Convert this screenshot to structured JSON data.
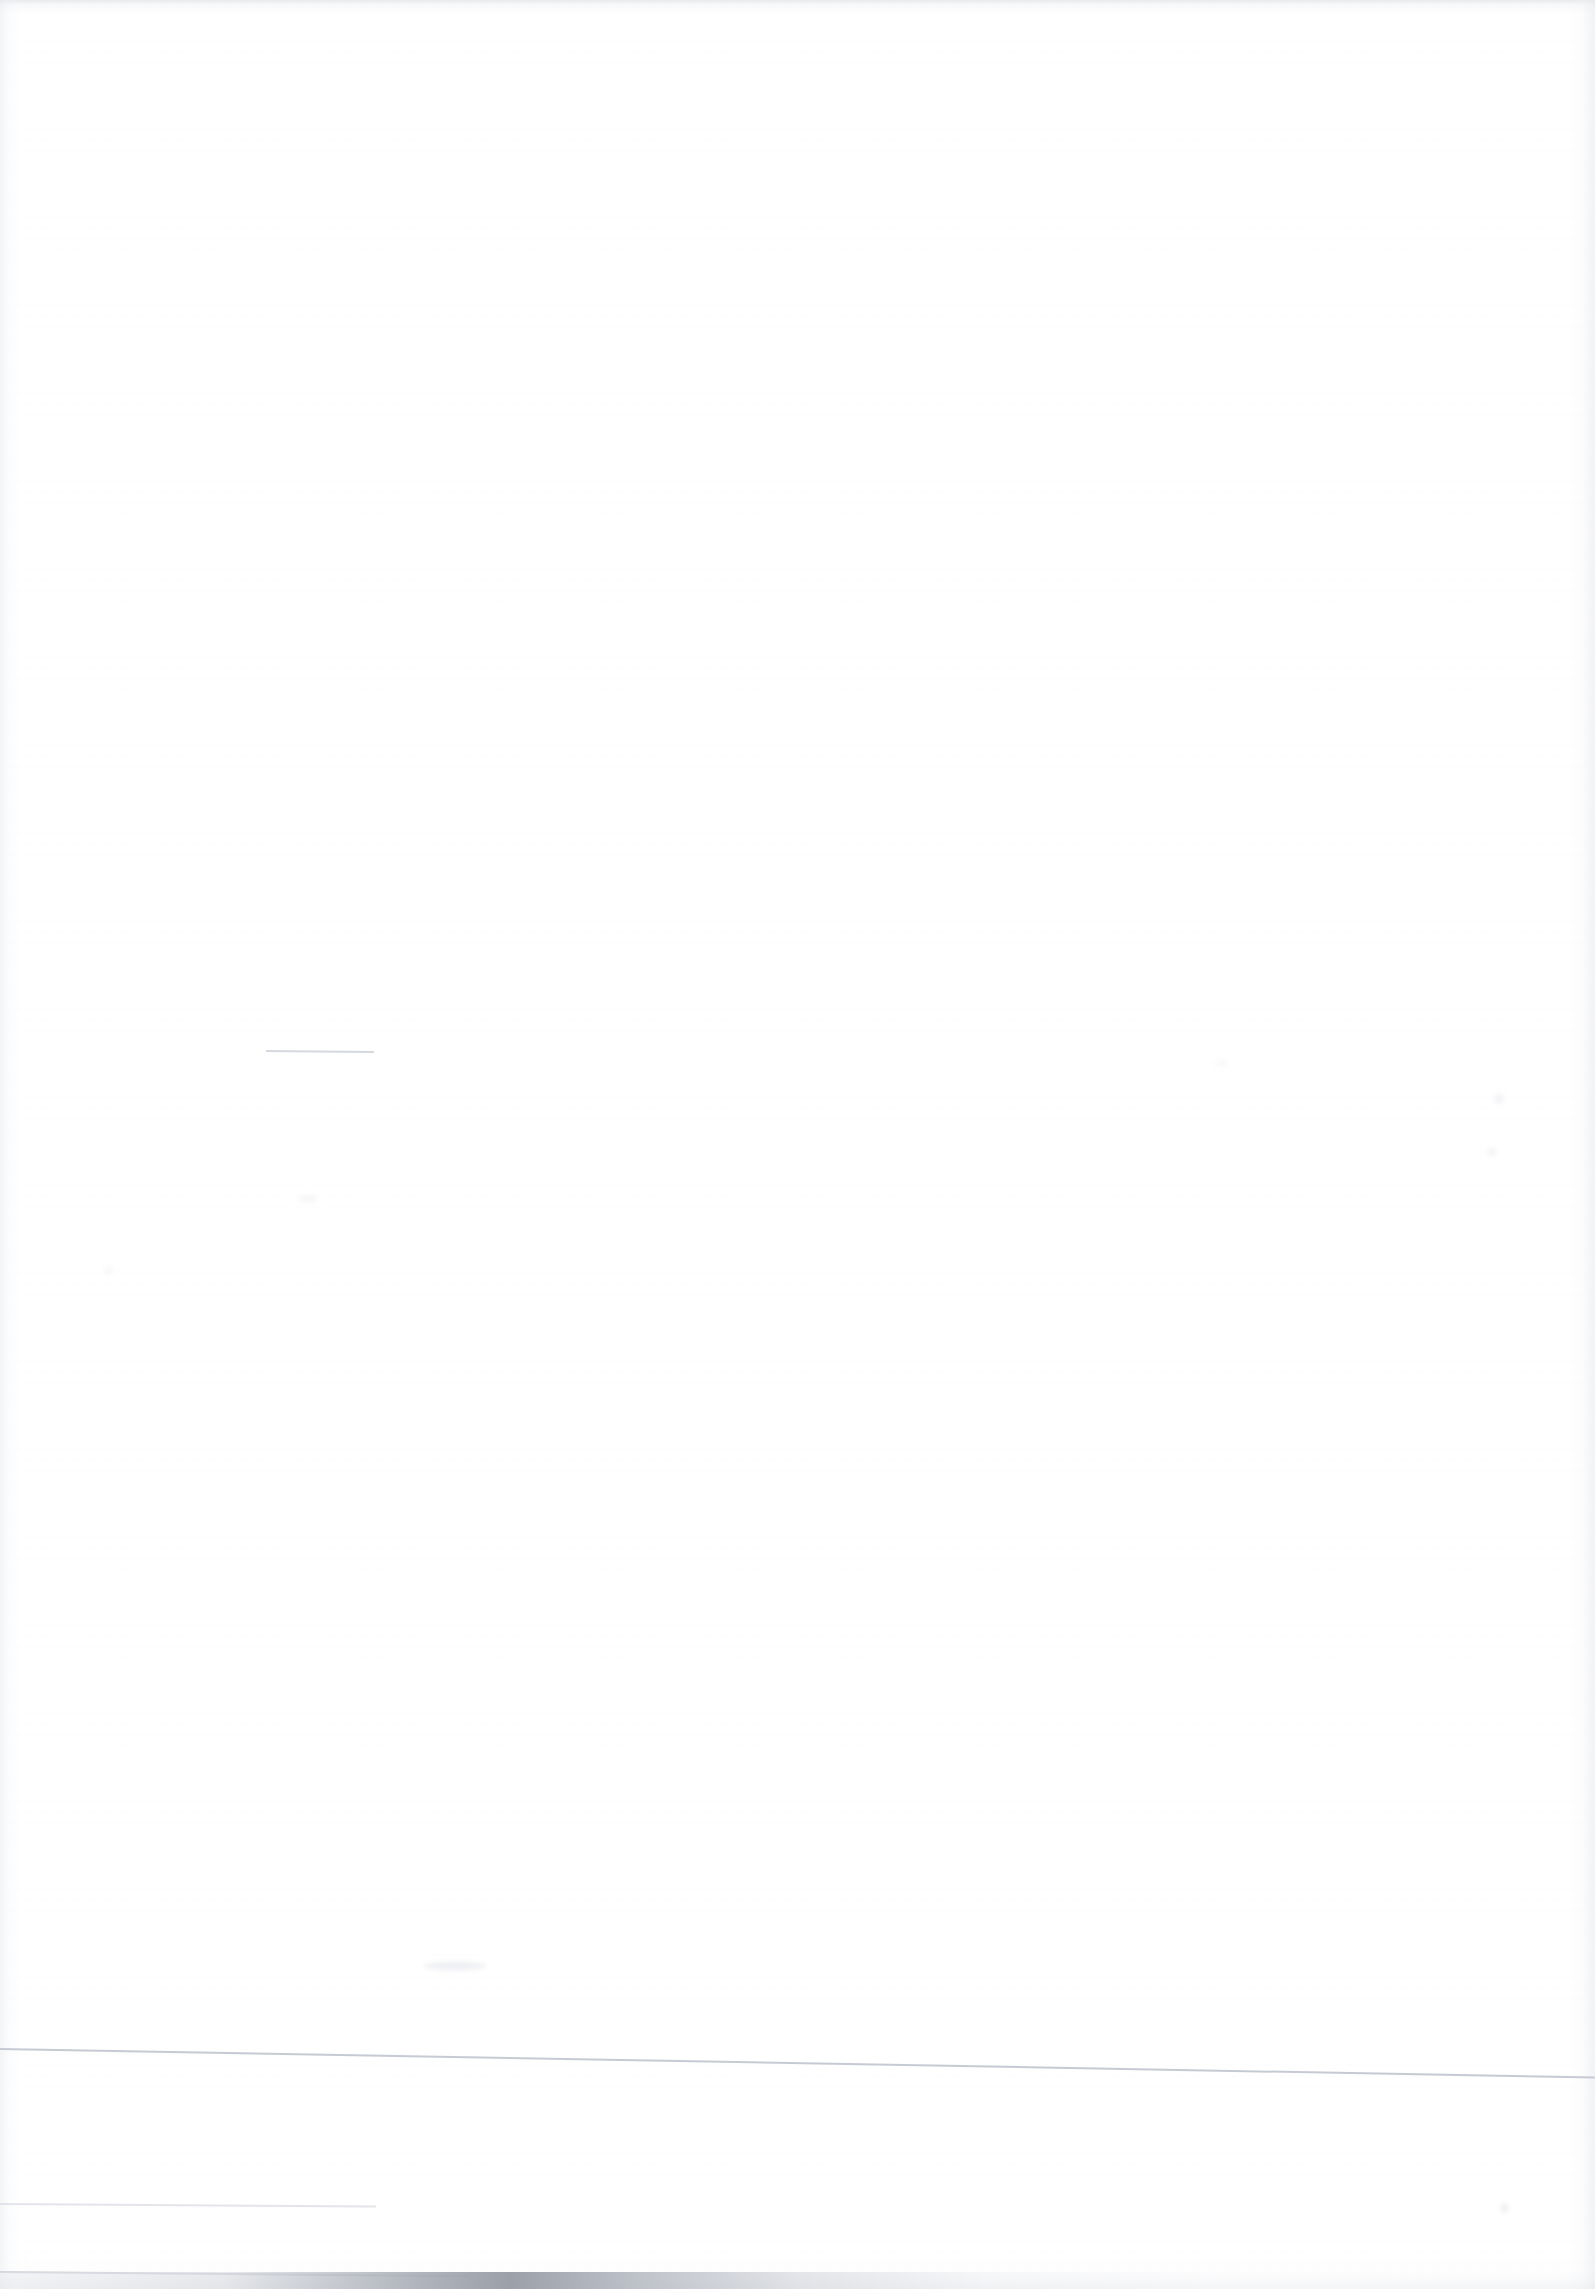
{
  "document": {
    "kind": "scanned-page",
    "orientation": "portrait",
    "page_width_px": 1595,
    "page_height_px": 2289,
    "visible_text": "",
    "content_summary": "Blank scanned document page — no legible text, headings, figures or tables are rendered in the pixels.",
    "background_color": "#ffffff",
    "paper_tint_color": "#fbfbfc"
  },
  "marks": {
    "rules": [
      {
        "id": "rule-short-upper",
        "label": "short horizontal rule",
        "color": "#c9cdd5",
        "x": 266,
        "y": 1050,
        "length": 108,
        "thickness": 2,
        "rotation_deg": 0.55
      },
      {
        "id": "rule-long-lower",
        "label": "long horizontal rule spanning page width",
        "color": "#c1c5ce",
        "x": 0,
        "y": 2048,
        "length": 1595,
        "thickness": 2,
        "rotation_deg": 1.02
      },
      {
        "id": "rule-short-lower",
        "label": "short horizontal rule near bottom left",
        "color": "#dcdfe5",
        "x": 0,
        "y": 2203,
        "length": 376,
        "thickness": 2,
        "rotation_deg": 0.38
      },
      {
        "id": "rule-bottom-edge",
        "label": "thin rule at bottom page edge",
        "color": "#c4c8d0",
        "x": 0,
        "y": 2271,
        "length": 470,
        "thickness": 2,
        "rotation_deg": 0.52
      }
    ],
    "shadows": [
      {
        "id": "edge-shadow-top",
        "label": "top edge scan shadow",
        "color": "#d5d8de",
        "edge": "top",
        "extent_px": 14
      },
      {
        "id": "edge-shadow-left",
        "label": "left edge scan shadow",
        "color": "#e8eaee",
        "edge": "left",
        "extent_px": 22
      },
      {
        "id": "edge-shadow-right",
        "label": "right edge scan shadow",
        "color": "#e6e8ed",
        "edge": "right",
        "extent_px": 26
      },
      {
        "id": "bottom-shadow-band",
        "label": "bottom edge scan shadow band",
        "color": "#969ba5",
        "edge": "bottom",
        "extent_px": 17
      }
    ],
    "speckles": [
      {
        "id": "smudge-a",
        "label": "faint smudge",
        "x": 424,
        "y": 1962,
        "color": "#e7e8ee"
      },
      {
        "id": "smudge-b",
        "label": "faint speck",
        "x": 298,
        "y": 1196,
        "color": "#f0f1f5"
      },
      {
        "id": "smudge-c",
        "label": "faint speck",
        "x": 1494,
        "y": 1094,
        "color": "#eeeff4"
      },
      {
        "id": "smudge-d",
        "label": "faint speck",
        "x": 1488,
        "y": 1148,
        "color": "#ecedf3"
      },
      {
        "id": "smudge-e",
        "label": "faint speck",
        "x": 1501,
        "y": 2204,
        "color": "#e5e7ed"
      },
      {
        "id": "smudge-f",
        "label": "faint speck",
        "x": 104,
        "y": 1267,
        "color": "#f1f2f6"
      },
      {
        "id": "smudge-g",
        "label": "faint speck",
        "x": 1216,
        "y": 1060,
        "color": "#f2f3f6"
      }
    ]
  },
  "accessibility": {
    "blank_page_note": "This page of the scanned document contains no readable content."
  }
}
